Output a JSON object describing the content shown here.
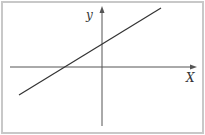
{
  "diagram": {
    "type": "coordinate-plane-linear-function",
    "axes": {
      "x_label": "X",
      "y_label": "y"
    },
    "line": {
      "slope_sign": "positive",
      "y_intercept_sign": "positive",
      "x_intercept_sign": "negative"
    },
    "colors": {
      "border": "#c8c8c8",
      "axis": "#555555",
      "line": "#333333",
      "background": "#ffffff"
    }
  }
}
